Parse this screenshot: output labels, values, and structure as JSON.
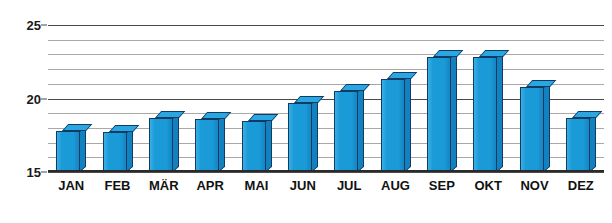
{
  "chart_data": {
    "type": "bar",
    "title": "",
    "xlabel": "",
    "ylabel": "",
    "categories": [
      "JAN",
      "FEB",
      "MÄR",
      "APR",
      "MAI",
      "JUN",
      "JUL",
      "AUG",
      "SEP",
      "OKT",
      "NOV",
      "DEZ"
    ],
    "values": [
      17.8,
      17.7,
      18.7,
      18.6,
      18.5,
      19.7,
      20.5,
      21.3,
      22.8,
      22.8,
      20.8,
      18.7
    ],
    "ylim": [
      15,
      25
    ],
    "ytick_labels": [
      "25",
      "20",
      "15"
    ],
    "ytick_values": [
      25,
      20,
      15
    ],
    "gridline_values": [
      25,
      24,
      23,
      22,
      21,
      20,
      19,
      18,
      17,
      16,
      15
    ],
    "major_gridline_values": [
      25,
      20,
      15
    ],
    "grid": true,
    "legend": false,
    "style": "3d-columns",
    "colors": {
      "bar_face": "#1b9ad8",
      "bar_top": "#2aa7e0",
      "bar_side": "#1182bf",
      "bar_outline": "#123a63",
      "gridline": "#a8a8a8",
      "axis": "#2a2a2a",
      "text": "#111111",
      "background": "#ffffff"
    }
  }
}
